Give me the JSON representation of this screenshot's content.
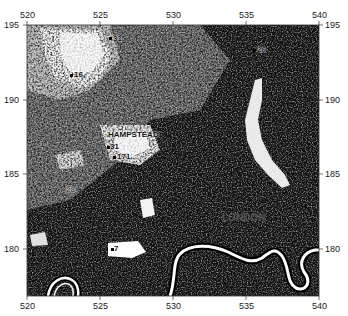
{
  "map": {
    "type": "grayscale satellite / land-cover raster",
    "region": "London",
    "x_axis": {
      "ticks": [
        "520",
        "525",
        "530",
        "535",
        "540"
      ],
      "range": [
        520,
        540
      ]
    },
    "y_axis": {
      "ticks": [
        "195",
        "190",
        "185",
        "180"
      ],
      "range": [
        177,
        195
      ]
    },
    "place_labels": [
      {
        "id": "hampstead",
        "text": "HAMPSTEAD"
      },
      {
        "id": "london",
        "text": "LONDON"
      }
    ],
    "site_markers": [
      {
        "id": "m31a",
        "text": "31"
      },
      {
        "id": "m16",
        "text": "16"
      },
      {
        "id": "m26",
        "text": "26"
      },
      {
        "id": "m1",
        "text": "1"
      },
      {
        "id": "m31b",
        "text": "31"
      },
      {
        "id": "m171",
        "text": "171"
      },
      {
        "id": "m28",
        "text": "28"
      },
      {
        "id": "m7",
        "text": "7"
      }
    ],
    "features": [
      "River Thames (white meandering line)",
      "Lee Valley (white north-south band)"
    ]
  }
}
